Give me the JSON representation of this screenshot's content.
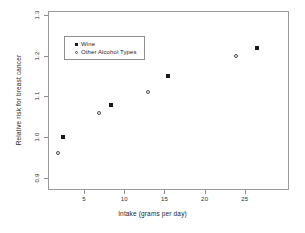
{
  "chart_data": {
    "type": "scatter",
    "title": "",
    "xlabel": "Intake (grams per day)",
    "ylabel": "Relative risk for breast cancer",
    "xlim": [
      0.5,
      30.5
    ],
    "ylim": [
      0.87,
      1.31
    ],
    "xticks": [
      5,
      10,
      15,
      20,
      25
    ],
    "xticklabels": [
      "5",
      "10",
      "15",
      "20",
      "25"
    ],
    "yticks": [
      0.9,
      1.0,
      1.1,
      1.2,
      1.3
    ],
    "yticklabels": [
      "0.9",
      "1.0",
      "1.1",
      "1.2",
      "1.3"
    ],
    "grid": false,
    "legend_position": "upper-left-inside",
    "series": [
      {
        "name": "Wine",
        "marker": "filled-square",
        "color": "#1a1a1a",
        "points": [
          {
            "x": 2.4,
            "y": 1.0
          },
          {
            "x": 8.4,
            "y": 1.08
          },
          {
            "x": 15.4,
            "y": 1.15
          },
          {
            "x": 26.5,
            "y": 1.22
          }
        ]
      },
      {
        "name": "Other Alcohol Types",
        "marker": "open-circle",
        "color": "#4a4a4a",
        "points": [
          {
            "x": 1.8,
            "y": 0.96
          },
          {
            "x": 6.9,
            "y": 1.06
          },
          {
            "x": 13.0,
            "y": 1.11
          },
          {
            "x": 23.9,
            "y": 1.2
          }
        ]
      }
    ]
  },
  "legend": {
    "entries": [
      {
        "label": "Wine",
        "marker": "filled-square"
      },
      {
        "label": "Other Alcohol Types",
        "marker": "open-circle"
      }
    ]
  }
}
